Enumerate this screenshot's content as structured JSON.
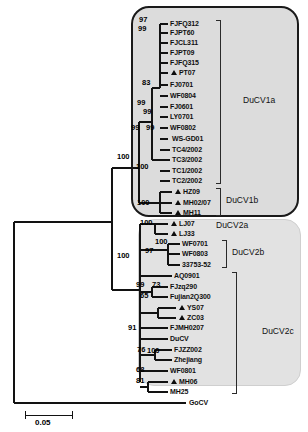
{
  "figure": {
    "type": "phylogenetic-tree",
    "scale_bar": {
      "label": "0.05",
      "value": 0.05
    },
    "outgroup": "GoCV",
    "marker_legend": "filled triangle denotes strain sequenced in this study"
  },
  "clades": [
    {
      "id": "ducv1a",
      "label": "DuCV1a"
    },
    {
      "id": "ducv1b",
      "label": "DuCV1b"
    },
    {
      "id": "ducv2a",
      "label": "DuCV2a"
    },
    {
      "id": "ducv2b",
      "label": "DuCV2b"
    },
    {
      "id": "ducv2c",
      "label": "DuCV2c"
    }
  ],
  "tips": [
    {
      "label": "FJFQ312",
      "clade": "ducv1a",
      "marked": false
    },
    {
      "label": "FJPT60",
      "clade": "ducv1a",
      "marked": false
    },
    {
      "label": "FJCL311",
      "clade": "ducv1a",
      "marked": false
    },
    {
      "label": "FJPT09",
      "clade": "ducv1a",
      "marked": false
    },
    {
      "label": "FJFQ315",
      "clade": "ducv1a",
      "marked": false
    },
    {
      "label": "PT07",
      "clade": "ducv1a",
      "marked": true
    },
    {
      "label": "FJ0701",
      "clade": "ducv1a",
      "marked": false
    },
    {
      "label": "WF0804",
      "clade": "ducv1a",
      "marked": false
    },
    {
      "label": "FJ0601",
      "clade": "ducv1a",
      "marked": false
    },
    {
      "label": "LY0701",
      "clade": "ducv1a",
      "marked": false
    },
    {
      "label": "WF0802",
      "clade": "ducv1a",
      "marked": false
    },
    {
      "label": "WS-GD01",
      "clade": "ducv1a",
      "marked": false
    },
    {
      "label": "TC4/2002",
      "clade": "ducv1a",
      "marked": false
    },
    {
      "label": "TC3/2002",
      "clade": "ducv1a",
      "marked": false
    },
    {
      "label": "TC1/2002",
      "clade": "ducv1a",
      "marked": false
    },
    {
      "label": "TC2/2002",
      "clade": "ducv1a",
      "marked": false
    },
    {
      "label": "HZ09",
      "clade": "ducv1b",
      "marked": true
    },
    {
      "label": "MH02/07",
      "clade": "ducv1b",
      "marked": true
    },
    {
      "label": "MH11",
      "clade": "ducv1b",
      "marked": true
    },
    {
      "label": "LJ07",
      "clade": "ducv2a",
      "marked": true
    },
    {
      "label": "LJ33",
      "clade": "ducv2a",
      "marked": true
    },
    {
      "label": "WF0701",
      "clade": "ducv2b",
      "marked": false
    },
    {
      "label": "WF0803",
      "clade": "ducv2b",
      "marked": false
    },
    {
      "label": "33753-52",
      "clade": "ducv2b",
      "marked": false
    },
    {
      "label": "AQ0901",
      "clade": "ducv2c",
      "marked": false
    },
    {
      "label": "FJzq290",
      "clade": "ducv2c",
      "marked": false
    },
    {
      "label": "Fujian2Q300",
      "clade": "ducv2c",
      "marked": false
    },
    {
      "label": "YS07",
      "clade": "ducv2c",
      "marked": true
    },
    {
      "label": "ZC03",
      "clade": "ducv2c",
      "marked": true
    },
    {
      "label": "FJMH0207",
      "clade": "ducv2c",
      "marked": false
    },
    {
      "label": "DuCV",
      "clade": "ducv2c",
      "marked": false
    },
    {
      "label": "FJZZ002",
      "clade": "ducv2c",
      "marked": false
    },
    {
      "label": "Zhejiang",
      "clade": "ducv2c",
      "marked": false
    },
    {
      "label": "WF0801",
      "clade": "ducv2c",
      "marked": false
    },
    {
      "label": "MH06",
      "clade": "ducv2c",
      "marked": true
    },
    {
      "label": "MH25",
      "clade": "ducv2c",
      "marked": false
    },
    {
      "label": "GoCV",
      "clade": "outgroup",
      "marked": false
    }
  ],
  "bootstrap": [
    {
      "id": "b97",
      "value": "97"
    },
    {
      "id": "b99a",
      "value": "99"
    },
    {
      "id": "b83",
      "value": "83"
    },
    {
      "id": "b99b",
      "value": "99"
    },
    {
      "id": "b99c",
      "value": "99"
    },
    {
      "id": "b99d",
      "value": "99"
    },
    {
      "id": "b99e",
      "value": "99"
    },
    {
      "id": "b100a",
      "value": "100"
    },
    {
      "id": "b100b",
      "value": "100"
    },
    {
      "id": "b100c",
      "value": "100"
    },
    {
      "id": "b100d",
      "value": "100"
    },
    {
      "id": "b100e",
      "value": "100"
    },
    {
      "id": "b97b",
      "value": "97"
    },
    {
      "id": "b100f",
      "value": "100"
    },
    {
      "id": "b99f",
      "value": "99"
    },
    {
      "id": "b73",
      "value": "73"
    },
    {
      "id": "b65",
      "value": "65"
    },
    {
      "id": "b91",
      "value": "91"
    },
    {
      "id": "b76",
      "value": "76"
    },
    {
      "id": "b100g",
      "value": "100"
    },
    {
      "id": "b68",
      "value": "68"
    },
    {
      "id": "b81",
      "value": "81"
    }
  ]
}
